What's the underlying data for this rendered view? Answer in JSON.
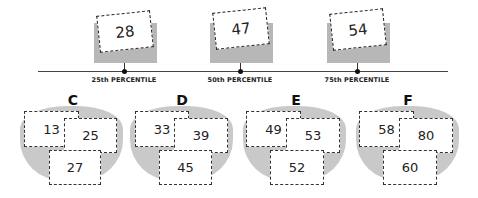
{
  "percentiles": [
    {
      "label": "25th PERCENTILE",
      "value": "28"
    },
    {
      "label": "50th PERCENTILE",
      "value": "47"
    },
    {
      "label": "75th PERCENTILE",
      "value": "54"
    }
  ],
  "groups": [
    {
      "letter": "C",
      "values": [
        "13",
        "25",
        "27"
      ]
    },
    {
      "letter": "D",
      "values": [
        "33",
        "39",
        "45"
      ]
    },
    {
      "letter": "E",
      "values": [
        "49",
        "53",
        "52"
      ]
    },
    {
      "letter": "F",
      "values": [
        "58",
        "80",
        "60"
      ]
    }
  ],
  "colors": {
    "gray_block": "#b7b7b7",
    "blob": "#c9c9c9",
    "line": "#444444"
  }
}
